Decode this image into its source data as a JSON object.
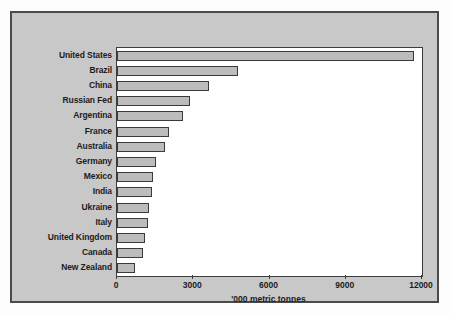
{
  "chart_data": {
    "type": "bar",
    "orientation": "horizontal",
    "title": "",
    "subtitle": "",
    "xlabel": "'000 metric tonnes",
    "ylabel": "",
    "xlim": [
      0,
      12000
    ],
    "xticks": [
      0,
      3000,
      6000,
      9000,
      12000
    ],
    "xtick_labels": [
      "0",
      "3000",
      "6000",
      "9000",
      "12000"
    ],
    "grid": false,
    "legend": null,
    "categories": [
      "United States",
      "Brazil",
      "China",
      "Russian Fed",
      "Argentina",
      "France",
      "Australia",
      "Germany",
      "Mexico",
      "India",
      "Ukraine",
      "Italy",
      "United Kingdom",
      "Canada",
      "New Zealand"
    ],
    "values": [
      11700,
      4750,
      3600,
      2870,
      2590,
      2050,
      1890,
      1530,
      1420,
      1380,
      1260,
      1220,
      1100,
      1020,
      710
    ],
    "colors": {
      "bar_fill": "#bcbcbc",
      "bar_edge": "#3a3a3a",
      "panel_background": "#c8c8c8",
      "plot_background": "#ffffff",
      "text": "#1c1c1c",
      "border": "#4a4a4a"
    }
  }
}
